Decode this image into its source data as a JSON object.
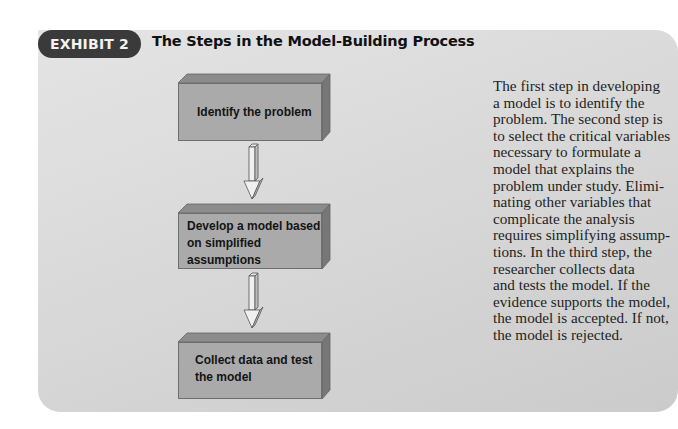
{
  "exhibit": {
    "badge_label": "EXHIBIT 2",
    "title": "The Steps in the Model-Building Process"
  },
  "flowchart": {
    "steps": [
      {
        "label_lines": [
          "Identify the problem"
        ]
      },
      {
        "label_lines": [
          "Develop a model based",
          "on simplified assumptions"
        ]
      },
      {
        "label_lines": [
          "Collect data and test",
          "the model"
        ]
      }
    ],
    "arrows": [
      "down-arrow",
      "down-arrow"
    ]
  },
  "description": {
    "lines": [
      "The first step in developing",
      "a model is to identify the",
      "problem. The second step is",
      "to select the critical variables",
      "necessary to formulate a",
      "model that explains the",
      "problem under study. Elimi-",
      "nating other variables that",
      "complicate the analysis",
      "requires simplifying assump-",
      "tions. In the third step, the",
      "researcher collects data",
      "and tests the model. If the",
      "evidence supports the model,",
      "the model is accepted. If not,",
      "the model is rejected."
    ]
  },
  "colors": {
    "badge_bg": "#3a3a3a",
    "panel_bg": "#d9d9d9",
    "box_front": "#aaaaaa",
    "box_top": "#8c8c8c",
    "box_side": "#7a7a7a"
  }
}
